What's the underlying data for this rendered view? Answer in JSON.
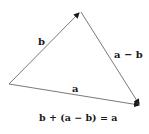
{
  "diagram": {
    "type": "vector-triangle",
    "colors": {
      "line": "#5a5a5a",
      "text": "#1a1a1a",
      "background": "#ffffff"
    },
    "points": {
      "origin": {
        "x": 9,
        "y": 84
      },
      "top": {
        "x": 80,
        "y": 12
      },
      "right": {
        "x": 140,
        "y": 105
      }
    },
    "vectors": [
      {
        "id": "b",
        "label": "b",
        "from": "origin",
        "to": "top"
      },
      {
        "id": "a-minus-b",
        "label": "a − b",
        "from": "top",
        "to": "right"
      },
      {
        "id": "a",
        "label": "a",
        "from": "origin",
        "to": "right"
      }
    ],
    "caption": "b + (a − b) = a"
  }
}
